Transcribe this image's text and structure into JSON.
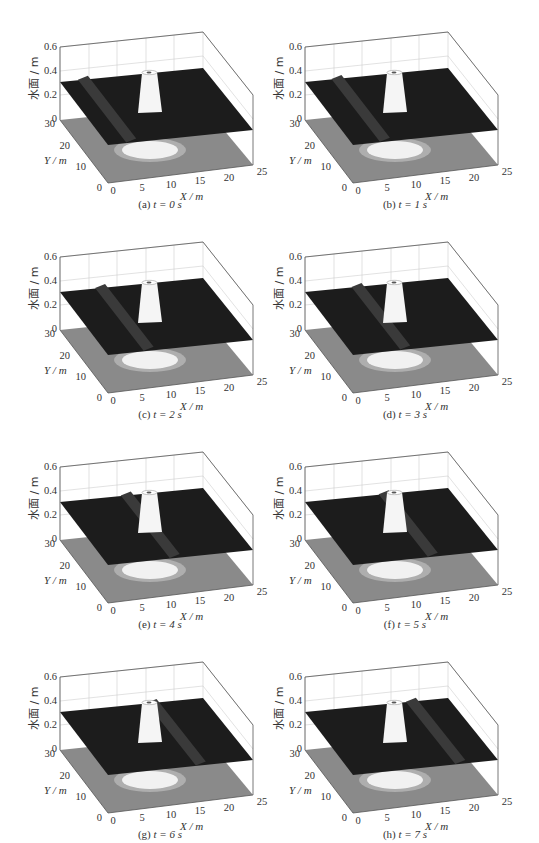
{
  "figure": {
    "panels": [
      {
        "id": "a",
        "label": "(a)",
        "t": "t = 0 s",
        "time_s": 0,
        "wave_x_frac": 0.16
      },
      {
        "id": "b",
        "label": "(b)",
        "t": "t = 1 s",
        "time_s": 1,
        "wave_x_frac": 0.22
      },
      {
        "id": "c",
        "label": "(c)",
        "t": "t = 2 s",
        "time_s": 2,
        "wave_x_frac": 0.28
      },
      {
        "id": "d",
        "label": "(d)",
        "t": "t = 3 s",
        "time_s": 3,
        "wave_x_frac": 0.36
      },
      {
        "id": "e",
        "label": "(e)",
        "t": "t = 4 s",
        "time_s": 4,
        "wave_x_frac": 0.46
      },
      {
        "id": "f",
        "label": "(f)",
        "t": "t = 5 s",
        "time_s": 5,
        "wave_x_frac": 0.55
      },
      {
        "id": "g",
        "label": "(g)",
        "t": "t = 6 s",
        "time_s": 6,
        "wave_x_frac": 0.64
      },
      {
        "id": "h",
        "label": "(h)",
        "t": "t = 7 s",
        "time_s": 7,
        "wave_x_frac": 0.74
      }
    ],
    "axes": {
      "z_label": "水面 / m",
      "y_label": "Y / m",
      "x_label": "X / m",
      "z_ticks": [
        "0",
        "0.2",
        "0.4",
        "0.6"
      ],
      "y_ticks": [
        "0",
        "10",
        "20",
        "30"
      ],
      "x_ticks": [
        "0",
        "5",
        "10",
        "15",
        "20",
        "25"
      ]
    },
    "colors": {
      "water_surface": "#1c1c1c",
      "floor": "#8a8a8a",
      "island": "#f5f5f5",
      "box": "#555555"
    }
  },
  "chart_data": {
    "type": "surface3d",
    "title": "",
    "xlabel": "X / m",
    "ylabel": "Y / m",
    "zlabel": "水面 / m",
    "xlim": [
      0,
      25
    ],
    "ylim": [
      0,
      30
    ],
    "zlim": [
      0,
      0.6
    ],
    "x_ticks": [
      0,
      5,
      10,
      15,
      20,
      25
    ],
    "y_ticks": [
      0,
      10,
      20,
      30
    ],
    "z_ticks": [
      0,
      0.2,
      0.4,
      0.6
    ],
    "still_water_level_m": 0.32,
    "island": {
      "shape": "truncated cone",
      "center_x_m": 12.5,
      "center_y_m": 15,
      "top_elevation_m": 0.625
    },
    "frames": [
      {
        "panel": "(a)",
        "t_s": 0,
        "wave_crest_x_m": 4
      },
      {
        "panel": "(b)",
        "t_s": 1,
        "wave_crest_x_m": 5.5
      },
      {
        "panel": "(c)",
        "t_s": 2,
        "wave_crest_x_m": 7
      },
      {
        "panel": "(d)",
        "t_s": 3,
        "wave_crest_x_m": 9
      },
      {
        "panel": "(e)",
        "t_s": 4,
        "wave_crest_x_m": 11.5
      },
      {
        "panel": "(f)",
        "t_s": 5,
        "wave_crest_x_m": 13.5
      },
      {
        "panel": "(g)",
        "t_s": 6,
        "wave_crest_x_m": 16
      },
      {
        "panel": "(h)",
        "t_s": 7,
        "wave_crest_x_m": 18.5
      }
    ],
    "grid": true,
    "legend": null
  }
}
